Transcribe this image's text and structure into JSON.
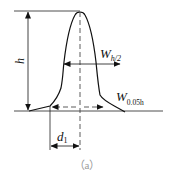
{
  "diagram": {
    "type": "chromatographic peak measurement",
    "labels": {
      "height": "h",
      "half_width_main": "W",
      "half_width_sub": "h/2",
      "base_width_main": "W",
      "base_width_sub": "0.05h",
      "distance_main": "d",
      "distance_sub": "1"
    },
    "caption": "（a）"
  }
}
